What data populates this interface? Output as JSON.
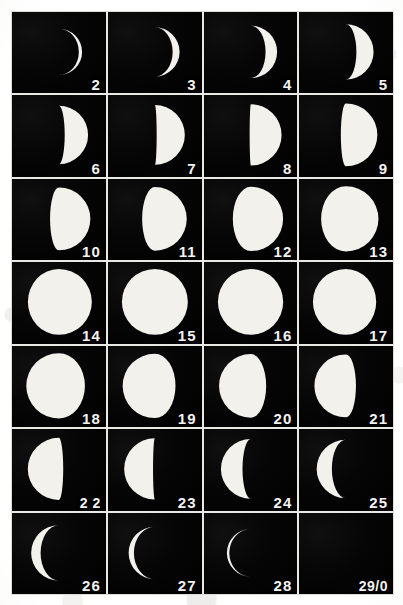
{
  "plate": {
    "title": "Lunar Phase Plate",
    "description": "Photographic plate showing the Moon through one synodic month",
    "columns": 4,
    "rows": 7,
    "paper_color": "#f4f3ef",
    "frame_color": "#030303",
    "moon_color": "#f2f1ec",
    "rule_color": "#e9e8e4"
  },
  "chart_data": {
    "type": "table",
    "xlabel": "",
    "ylabel": "",
    "categories": [
      "2",
      "3",
      "4",
      "5",
      "6",
      "7",
      "8",
      "9",
      "10",
      "11",
      "12",
      "13",
      "14",
      "15",
      "16",
      "17",
      "18",
      "19",
      "20",
      "21",
      "22",
      "23",
      "24",
      "25",
      "26",
      "27",
      "28",
      "29/0"
    ],
    "values": [
      0.07,
      0.14,
      0.22,
      0.31,
      0.4,
      0.47,
      0.52,
      0.58,
      0.64,
      0.7,
      0.78,
      0.88,
      0.97,
      1.0,
      0.99,
      0.96,
      0.9,
      0.82,
      0.74,
      0.66,
      0.57,
      0.47,
      0.36,
      0.26,
      0.17,
      0.1,
      0.05,
      0.0
    ],
    "series": [
      {
        "name": "illuminated fraction",
        "values": [
          0.07,
          0.14,
          0.22,
          0.31,
          0.4,
          0.47,
          0.52,
          0.58,
          0.64,
          0.7,
          0.78,
          0.88,
          0.97,
          1.0,
          0.99,
          0.96,
          0.9,
          0.82,
          0.74,
          0.66,
          0.57,
          0.47,
          0.36,
          0.26,
          0.17,
          0.1,
          0.05,
          0.0
        ]
      }
    ]
  },
  "cells": [
    {
      "label": "2",
      "phase": 0.07,
      "lit_side": "right",
      "diameter": 0.62,
      "row": 1,
      "col": 1
    },
    {
      "label": "3",
      "phase": 0.14,
      "lit_side": "right",
      "diameter": 0.66,
      "row": 1,
      "col": 2
    },
    {
      "label": "4",
      "phase": 0.22,
      "lit_side": "right",
      "diameter": 0.7,
      "row": 1,
      "col": 3
    },
    {
      "label": "5",
      "phase": 0.31,
      "lit_side": "right",
      "diameter": 0.74,
      "row": 1,
      "col": 4
    },
    {
      "label": "6",
      "phase": 0.4,
      "lit_side": "right",
      "diameter": 0.78,
      "row": 2,
      "col": 1
    },
    {
      "label": "7",
      "phase": 0.47,
      "lit_side": "right",
      "diameter": 0.8,
      "row": 2,
      "col": 2
    },
    {
      "label": "8",
      "phase": 0.52,
      "lit_side": "right",
      "diameter": 0.82,
      "row": 2,
      "col": 3
    },
    {
      "label": "9",
      "phase": 0.58,
      "lit_side": "right",
      "diameter": 0.84,
      "row": 2,
      "col": 4
    },
    {
      "label": "10",
      "phase": 0.64,
      "lit_side": "right",
      "diameter": 0.84,
      "row": 3,
      "col": 1
    },
    {
      "label": "11",
      "phase": 0.7,
      "lit_side": "right",
      "diameter": 0.85,
      "row": 3,
      "col": 2
    },
    {
      "label": "12",
      "phase": 0.78,
      "lit_side": "right",
      "diameter": 0.86,
      "row": 3,
      "col": 3
    },
    {
      "label": "13",
      "phase": 0.88,
      "lit_side": "right",
      "diameter": 0.87,
      "row": 3,
      "col": 4
    },
    {
      "label": "14",
      "phase": 0.97,
      "lit_side": "right",
      "diameter": 0.88,
      "row": 4,
      "col": 1
    },
    {
      "label": "15",
      "phase": 1.0,
      "lit_side": "right",
      "diameter": 0.88,
      "row": 4,
      "col": 2
    },
    {
      "label": "16",
      "phase": 0.99,
      "lit_side": "left",
      "diameter": 0.88,
      "row": 4,
      "col": 3
    },
    {
      "label": "17",
      "phase": 0.96,
      "lit_side": "left",
      "diameter": 0.88,
      "row": 4,
      "col": 4
    },
    {
      "label": "18",
      "phase": 0.9,
      "lit_side": "left",
      "diameter": 0.87,
      "row": 5,
      "col": 1
    },
    {
      "label": "19",
      "phase": 0.82,
      "lit_side": "left",
      "diameter": 0.86,
      "row": 5,
      "col": 2
    },
    {
      "label": "20",
      "phase": 0.74,
      "lit_side": "left",
      "diameter": 0.85,
      "row": 5,
      "col": 3
    },
    {
      "label": "21",
      "phase": 0.66,
      "lit_side": "left",
      "diameter": 0.84,
      "row": 5,
      "col": 4
    },
    {
      "label": "2 2",
      "phase": 0.57,
      "lit_side": "left",
      "diameter": 0.83,
      "row": 6,
      "col": 1
    },
    {
      "label": "23",
      "phase": 0.47,
      "lit_side": "left",
      "diameter": 0.82,
      "row": 6,
      "col": 2
    },
    {
      "label": "24",
      "phase": 0.36,
      "lit_side": "left",
      "diameter": 0.8,
      "row": 6,
      "col": 3
    },
    {
      "label": "25",
      "phase": 0.26,
      "lit_side": "left",
      "diameter": 0.78,
      "row": 6,
      "col": 4
    },
    {
      "label": "26",
      "phase": 0.17,
      "lit_side": "left",
      "diameter": 0.74,
      "row": 7,
      "col": 1
    },
    {
      "label": "27",
      "phase": 0.1,
      "lit_side": "left",
      "diameter": 0.7,
      "row": 7,
      "col": 2
    },
    {
      "label": "28",
      "phase": 0.05,
      "lit_side": "left",
      "diameter": 0.64,
      "row": 7,
      "col": 3
    },
    {
      "label": "29/0",
      "phase": 0.0,
      "lit_side": "left",
      "diameter": 0.6,
      "row": 7,
      "col": 4
    }
  ]
}
